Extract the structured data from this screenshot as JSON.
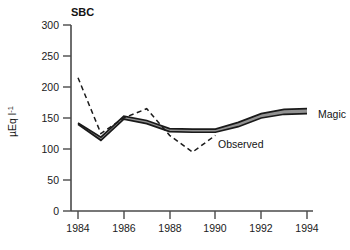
{
  "chart_data": {
    "type": "line",
    "title": "SBC",
    "xlabel": "",
    "ylabel": "µEq l",
    "ylabel_exponent": "-1",
    "xlim": [
      1984,
      1994
    ],
    "ylim": [
      0,
      300
    ],
    "grid": false,
    "legend_position": "inline-annotations",
    "xticks": [
      "1984",
      "1986",
      "1988",
      "1990",
      "1992",
      "1994"
    ],
    "xtick_values": [
      1984,
      1986,
      1988,
      1990,
      1992,
      1994
    ],
    "xminorticks": [
      1984,
      1985,
      1986,
      1987,
      1988,
      1989,
      1990,
      1991,
      1992,
      1993,
      1994
    ],
    "yticks": [
      "0",
      "50",
      "100",
      "150",
      "200",
      "250",
      "300"
    ],
    "ytick_values": [
      0,
      50,
      100,
      150,
      200,
      250,
      300
    ],
    "x": [
      1984,
      1985,
      1986,
      1987,
      1988,
      1989,
      1990,
      1991,
      1992,
      1993,
      1994
    ],
    "series": [
      {
        "name": "Magic",
        "style": "band-upper",
        "values": [
          142,
          119,
          153,
          146,
          133,
          132,
          132,
          143,
          157,
          164,
          165
        ]
      },
      {
        "name": "Magic",
        "style": "band-lower",
        "values": [
          140,
          114,
          148,
          141,
          128,
          127,
          127,
          136,
          150,
          156,
          157
        ]
      },
      {
        "name": "Observed",
        "style": "dashed",
        "values": [
          215,
          125,
          150,
          165,
          122,
          95,
          122,
          null,
          null,
          null,
          null
        ]
      }
    ],
    "annotations": [
      {
        "text": "Magic",
        "x": 1994,
        "y": 165,
        "anchor": "left"
      },
      {
        "text": "Observed",
        "x": 1990,
        "y": 113,
        "anchor": "left"
      }
    ],
    "colors": {
      "axis": "#4a4a4a",
      "band_fill": "#8c8c8c",
      "band_edge": "#1a1a1a",
      "observed_line": "#1a1a1a",
      "text": "#1a1a1a"
    }
  }
}
